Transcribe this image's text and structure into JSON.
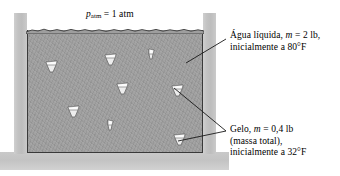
{
  "figure": {
    "name": "ice-water-piston-vessel-diagram",
    "pressure_label": {
      "symbol": "p",
      "subscript": "atm",
      "equals": " = 1 atm",
      "full_text": "patm = 1 atm"
    },
    "annotations": [
      {
        "id": "water",
        "lines": [
          {
            "pre": "Água líquida, ",
            "em": "m",
            "post": " = 2 lb,"
          },
          {
            "pre": "inicialmente a 80°F",
            "em": "",
            "post": ""
          }
        ]
      },
      {
        "id": "ice",
        "lines": [
          {
            "pre": "Gelo, ",
            "em": "m",
            "post": " = 0,4 lb"
          },
          {
            "pre": "(massa total),",
            "em": "",
            "post": ""
          },
          {
            "pre": "inicialmente a 32°F",
            "em": "",
            "post": ""
          }
        ]
      }
    ],
    "colors": {
      "water_fill": "#9e9e9e",
      "wall_fill": "#c5c5c5",
      "base_fill": "#c9c9c9",
      "outline": "#3a3a3a",
      "text": "#000000",
      "ice_fill": "#e8e8e8",
      "background": "#ffffff"
    },
    "ice_pieces": [
      {
        "x": 44,
        "y": 59,
        "size": "large"
      },
      {
        "x": 103,
        "y": 52,
        "size": "large"
      },
      {
        "x": 147,
        "y": 48,
        "size": "small"
      },
      {
        "x": 115,
        "y": 81,
        "size": "large"
      },
      {
        "x": 170,
        "y": 83,
        "size": "large"
      },
      {
        "x": 66,
        "y": 104,
        "size": "large"
      },
      {
        "x": 106,
        "y": 119,
        "size": "small"
      },
      {
        "x": 172,
        "y": 132,
        "size": "large"
      }
    ],
    "leader_lines": [
      {
        "id": "water-leader",
        "from": [
          226,
          39
        ],
        "to": [
          186,
          63
        ]
      },
      {
        "id": "ice-leader-upper",
        "from": [
          226,
          131
        ],
        "to": [
          174,
          88
        ]
      },
      {
        "id": "ice-leader-lower",
        "from": [
          226,
          131
        ],
        "to": [
          178,
          141
        ]
      }
    ]
  }
}
